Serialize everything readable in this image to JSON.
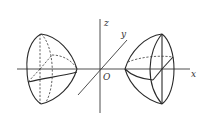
{
  "figure": {
    "type": "3d-solids-of-revolution",
    "axes": {
      "x_label": "x",
      "y_label": "y",
      "z_label": "z",
      "origin_label": "O"
    },
    "solids": [
      {
        "position": "left",
        "flat_face_side": "left",
        "tip_side": "right"
      },
      {
        "position": "right",
        "flat_face_side": "right",
        "tip_side": "left"
      }
    ],
    "colors": {
      "line": "#2a2a2a",
      "background": "#ffffff"
    }
  }
}
